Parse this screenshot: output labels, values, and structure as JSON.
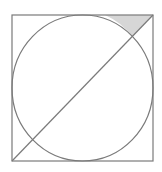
{
  "diagram": {
    "title": "",
    "colors": {
      "background": "#ffffff",
      "stroke": "#7a7a7a",
      "shade": "#d6d6d6"
    },
    "square": {
      "x": 12,
      "y": 15,
      "width": 141,
      "height": 146
    },
    "circle": {
      "cx": 82.5,
      "cy": 88,
      "rx": 70.5,
      "ry": 73
    },
    "diagonal": {
      "x1": 12,
      "y1": 161,
      "x2": 153,
      "y2": 15
    },
    "shaded_region": {
      "description": "Region bounded by top side of square, diagonal, and circle arc near top-right corner",
      "path": "M 153 15 L 105 15 A 70.5 73 0 0 1 132.4 36.6 Z"
    }
  }
}
